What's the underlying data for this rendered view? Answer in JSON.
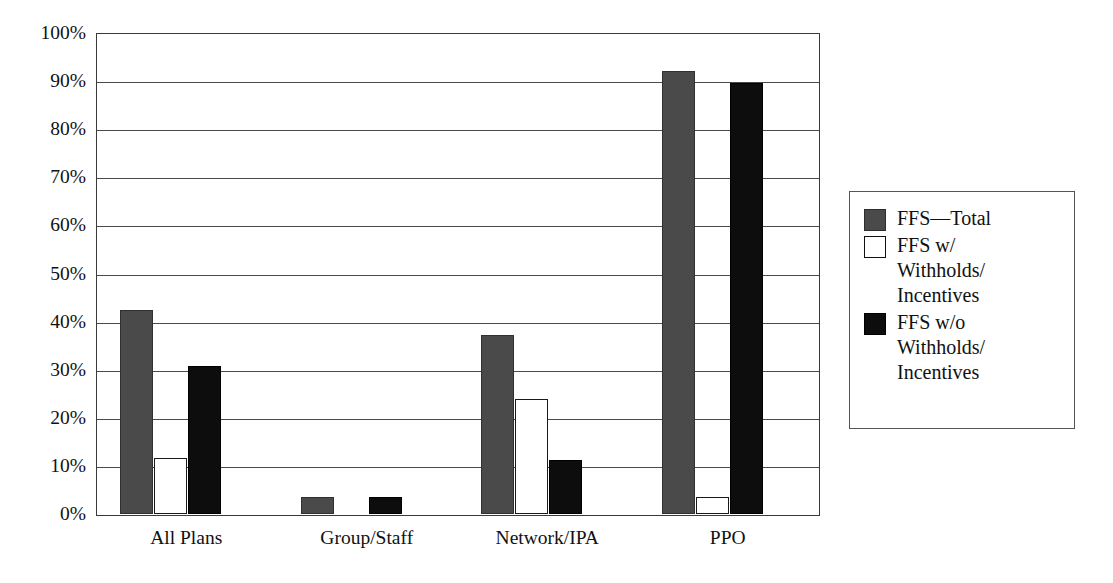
{
  "chart_data": {
    "type": "bar",
    "title": "",
    "subtitle": "",
    "xlabel": "",
    "ylabel": "",
    "categories": [
      "All Plans",
      "Group/Staff",
      "Network/IPA",
      "PPO"
    ],
    "series": [
      {
        "name": "FFS—Total",
        "color": "#4a4a4a",
        "values": [
          42.5,
          3.6,
          37.2,
          92.0
        ]
      },
      {
        "name": "FFS w/ Withholds/Incentives",
        "color": "#ffffff",
        "values": [
          11.7,
          0.0,
          24.0,
          3.5
        ]
      },
      {
        "name": "FFS w/o Withholds/Incentives",
        "color": "#0d0d0d",
        "values": [
          30.8,
          3.5,
          11.2,
          89.7
        ]
      }
    ],
    "ylim": [
      0,
      100
    ],
    "ytick_values": [
      0,
      10,
      20,
      30,
      40,
      50,
      60,
      70,
      80,
      90,
      100
    ],
    "ytick_labels": [
      "0%",
      "10%",
      "20%",
      "30%",
      "40%",
      "50%",
      "60%",
      "70%",
      "80%",
      "90%",
      "100%"
    ],
    "grid": "horizontal",
    "legend_position": "right-outside"
  },
  "legend": {
    "entries": [
      {
        "label": "FFS—Total",
        "swatch": "dark-gray-square"
      },
      {
        "label": "FFS w/\nWithholds/\nIncentives",
        "swatch": "white-square"
      },
      {
        "label": "FFS w/o\nWithholds/\nIncentives",
        "swatch": "black-square"
      }
    ]
  },
  "colors": {
    "series_total": "#4a4a4a",
    "series_with": "#ffffff",
    "series_without": "#0d0d0d",
    "axis": "#3a3a3a",
    "grid": "#4b4b4b",
    "background": "#ffffff"
  }
}
